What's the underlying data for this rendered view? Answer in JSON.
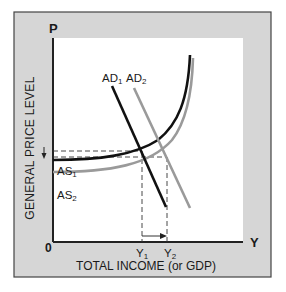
{
  "diagram": {
    "axes": {
      "y_axis_letter": "P",
      "x_axis_letter": "Y",
      "origin": "0",
      "y_label": "GENERAL PRICE LEVEL",
      "x_label": "TOTAL INCOME (or GDP)"
    },
    "curves": {
      "ad1": {
        "label": "AD",
        "sub": "1",
        "color": "#111111"
      },
      "ad2": {
        "label": "AD",
        "sub": "2",
        "color": "#9a9a9a"
      },
      "as1": {
        "label": "AS",
        "sub": "1",
        "color": "#111111"
      },
      "as2": {
        "label": "AS",
        "sub": "2",
        "color": "#9a9a9a"
      }
    },
    "ticks": {
      "y1": {
        "label": "Y",
        "sub": "1"
      },
      "y2": {
        "label": "Y",
        "sub": "2"
      }
    },
    "colors": {
      "frame_fill": "#d6d6d6",
      "frame_border": "#444444",
      "plot_bg": "#ffffff",
      "axis": "#222222"
    }
  }
}
